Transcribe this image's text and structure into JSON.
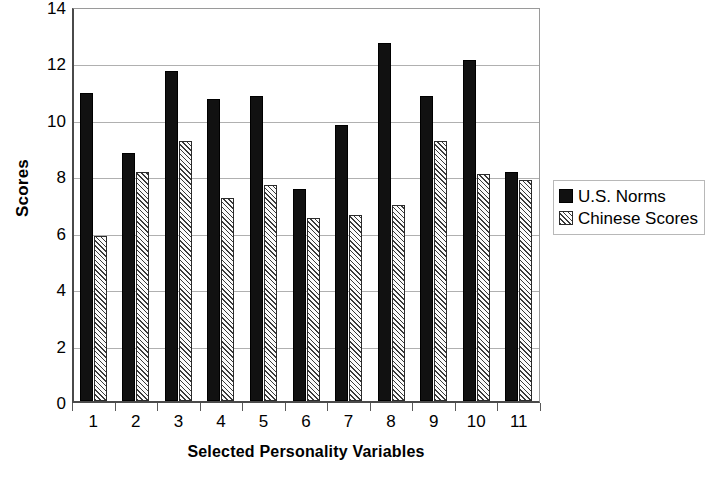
{
  "chart_data": {
    "type": "bar",
    "title": "",
    "xlabel": "Selected Personality Variables",
    "ylabel": "Scores",
    "categories": [
      "1",
      "2",
      "3",
      "4",
      "5",
      "6",
      "7",
      "8",
      "9",
      "10",
      "11"
    ],
    "series": [
      {
        "name": "U.S. Norms",
        "values": [
          10.9,
          8.8,
          11.7,
          10.7,
          10.8,
          7.5,
          9.8,
          12.7,
          10.8,
          12.1,
          8.1
        ]
      },
      {
        "name": "Chinese Scores",
        "values": [
          5.85,
          8.1,
          9.2,
          7.2,
          7.65,
          6.5,
          6.6,
          6.95,
          9.2,
          8.05,
          7.85
        ]
      }
    ],
    "ylim": [
      0,
      14
    ],
    "yticks": [
      0,
      2,
      4,
      6,
      8,
      10,
      12,
      14
    ],
    "ytick_labels": [
      "0",
      "2",
      "4",
      "6",
      "8",
      "10",
      "12",
      "14"
    ],
    "grid": "horizontal",
    "legend_position": "right",
    "colors": {
      "series_a": "#111111",
      "series_b_hatch": "#3a3a3a",
      "series_b_fill": "#fbfbfb",
      "gridline": "#b0b0b0",
      "axis": "#4a4a4a",
      "background": "#ffffff",
      "text": "#000000"
    }
  },
  "legend": {
    "items": [
      {
        "label": "U.S. Norms",
        "swatch": "solid-black-square-icon"
      },
      {
        "label": "Chinese Scores",
        "swatch": "hatched-square-icon"
      }
    ]
  }
}
